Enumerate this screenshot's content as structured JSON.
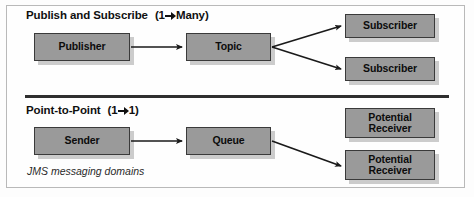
{
  "figure": {
    "caption": "JMS messaging domains"
  },
  "sections": [
    {
      "id": "publish-subscribe",
      "title": "Publish and Subscribe",
      "relation_from": "1",
      "relation_to": "Many",
      "relation_open": "(",
      "relation_close": ")",
      "nodes": {
        "source": "Publisher",
        "channel": "Topic",
        "target_1": "Subscriber",
        "target_2": "Subscriber"
      }
    },
    {
      "id": "point-to-point",
      "title": "Point-to-Point",
      "relation_from": "1",
      "relation_to": "1",
      "relation_open": "(",
      "relation_close": ")",
      "nodes": {
        "source": "Sender",
        "channel": "Queue",
        "target_1_line1": "Potential",
        "target_1_line2": "Receiver",
        "target_2_line1": "Potential",
        "target_2_line2": "Receiver"
      }
    }
  ],
  "colors": {
    "node_fill": "#9a9a9a",
    "node_border": "#3a3a3a",
    "node_shadow": "#cccccc",
    "line": "#1a1a1a",
    "frame": "#b9b9b9",
    "divider": "#2f2f2f"
  }
}
